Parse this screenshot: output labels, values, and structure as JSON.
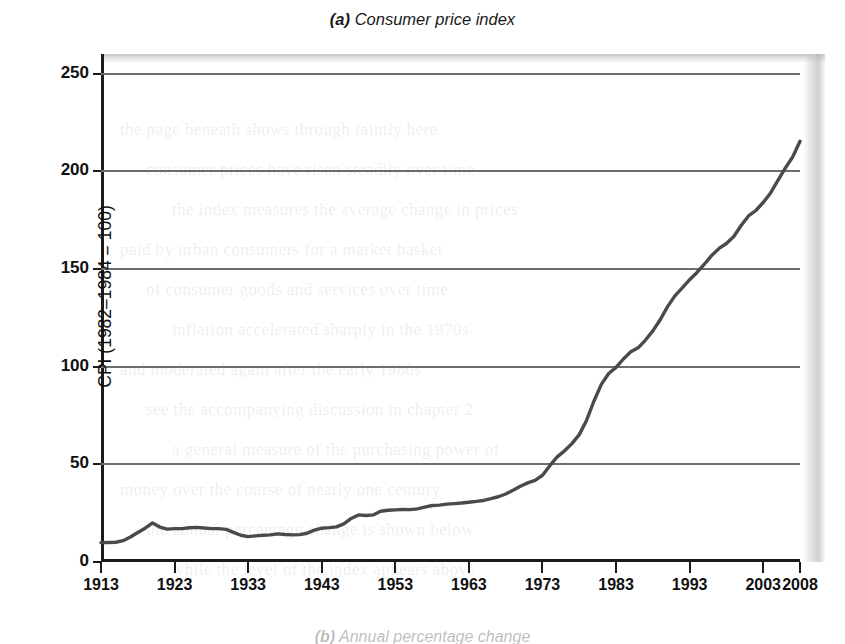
{
  "figure": {
    "panel_tag": "(a)",
    "panel_title": "Consumer price index",
    "next_panel_tag": "(b)",
    "next_panel_title": "Annual percentage change",
    "line_color": "#4a4a4a",
    "grid_color": "#6d6d6d",
    "axis_color": "#1b1b1b"
  },
  "chart_data": {
    "type": "line",
    "title": "(a) Consumer price index",
    "xlabel": "",
    "ylabel": "CPI (1982–1984 = 100)",
    "xlim": [
      1913,
      2008
    ],
    "ylim": [
      0,
      260
    ],
    "yticks": [
      0,
      50,
      100,
      150,
      200,
      250
    ],
    "ytick_labels": [
      "0",
      "50",
      "100",
      "150",
      "200",
      "250"
    ],
    "xticks": [
      1913,
      1923,
      1933,
      1943,
      1953,
      1963,
      1973,
      1983,
      1993,
      2003,
      2008
    ],
    "xtick_labels": [
      "1913",
      "1923",
      "1933",
      "1943",
      "1953",
      "1963",
      "1973",
      "1983",
      "1993",
      "2003",
      "2008"
    ],
    "grid": "horizontal",
    "legend": "none",
    "series": [
      {
        "name": "CPI (1982–1984 = 100)",
        "x": [
          1913,
          1914,
          1915,
          1916,
          1917,
          1918,
          1919,
          1920,
          1921,
          1922,
          1923,
          1924,
          1925,
          1926,
          1927,
          1928,
          1929,
          1930,
          1931,
          1932,
          1933,
          1934,
          1935,
          1936,
          1937,
          1938,
          1939,
          1940,
          1941,
          1942,
          1943,
          1944,
          1945,
          1946,
          1947,
          1948,
          1949,
          1950,
          1951,
          1952,
          1953,
          1954,
          1955,
          1956,
          1957,
          1958,
          1959,
          1960,
          1961,
          1962,
          1963,
          1964,
          1965,
          1966,
          1967,
          1968,
          1969,
          1970,
          1971,
          1972,
          1973,
          1974,
          1975,
          1976,
          1977,
          1978,
          1979,
          1980,
          1981,
          1982,
          1983,
          1984,
          1985,
          1986,
          1987,
          1988,
          1989,
          1990,
          1991,
          1992,
          1993,
          1994,
          1995,
          1996,
          1997,
          1998,
          1999,
          2000,
          2001,
          2002,
          2003,
          2004,
          2005,
          2006,
          2007,
          2008
        ],
        "values": [
          9.9,
          10.0,
          10.1,
          10.9,
          12.8,
          15.1,
          17.3,
          20.0,
          17.9,
          16.8,
          17.1,
          17.1,
          17.5,
          17.7,
          17.4,
          17.1,
          17.1,
          16.7,
          15.2,
          13.7,
          13.0,
          13.4,
          13.7,
          13.9,
          14.4,
          14.1,
          13.9,
          14.0,
          14.7,
          16.3,
          17.3,
          17.6,
          18.0,
          19.5,
          22.3,
          24.1,
          23.8,
          24.1,
          26.0,
          26.5,
          26.7,
          26.9,
          26.8,
          27.2,
          28.1,
          28.9,
          29.1,
          29.6,
          29.9,
          30.2,
          30.6,
          31.0,
          31.5,
          32.4,
          33.4,
          34.8,
          36.7,
          38.8,
          40.5,
          41.8,
          44.4,
          49.3,
          53.8,
          56.9,
          60.6,
          65.2,
          72.6,
          82.4,
          90.9,
          96.5,
          99.6,
          103.9,
          107.6,
          109.6,
          113.6,
          118.3,
          124.0,
          130.7,
          136.2,
          140.3,
          144.5,
          148.2,
          152.4,
          156.9,
          160.5,
          163.0,
          166.6,
          172.2,
          177.1,
          179.9,
          184.0,
          188.9,
          195.3,
          201.6,
          207.3,
          215.3
        ]
      }
    ]
  },
  "ghost_text": {
    "lines": [
      "the page beneath shows through faintly here",
      "consumer prices have risen steadily over time",
      "the index measures the average change in prices",
      "paid by urban consumers for a market basket",
      "of consumer goods and services over time",
      "inflation accelerated sharply in the 1970s",
      "and moderated again after the early 1980s",
      "see the accompanying discussion in chapter 2",
      "a general measure of the purchasing power of",
      "money over the course of nearly one century",
      "the annual percentage change is shown below",
      "while the level of the index appears above"
    ]
  }
}
